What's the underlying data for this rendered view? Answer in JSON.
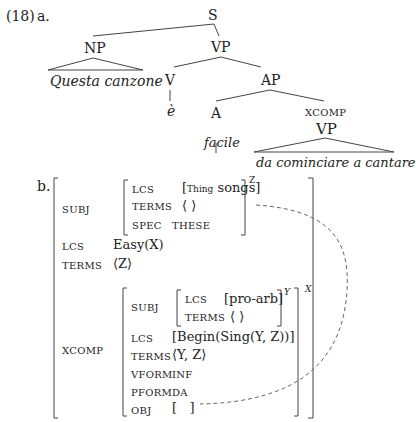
{
  "example": {
    "number": "(18)",
    "part_a": "a.",
    "part_b": "b."
  },
  "tree": {
    "root": "S",
    "np": "NP",
    "np_leaf": "Questa canzone",
    "vp": "VP",
    "v": "V",
    "v_leaf": "è",
    "ap": "AP",
    "a": "A",
    "a_leaf": "facile",
    "xcomp_label": "XCOMP",
    "xcomp_vp": "VP",
    "xcomp_leaf": "da cominciare a cantare"
  },
  "avm": {
    "subj": {
      "attr": "SUBJ",
      "lcs_attr": "LCS",
      "lcs_sub": "Thing",
      "lcs_val": "songs",
      "terms_attr": "TERMS",
      "terms_val": "⟨ ⟩",
      "spec_attr": "SPEC",
      "spec_val": "THESE",
      "index": "Z"
    },
    "lcs_attr": "LCS",
    "lcs_val": "Easy(X)",
    "terms_attr": "TERMS",
    "terms_val": "⟨Z⟩",
    "xcomp": {
      "attr": "XCOMP",
      "index": "X",
      "subj": {
        "attr": "SUBJ",
        "lcs_attr": "LCS",
        "lcs_val": "[pro-arb]",
        "terms_attr": "TERMS",
        "terms_val": "⟨ ⟩",
        "index": "Y"
      },
      "lcs_attr": "LCS",
      "lcs_val": "[Begin(Sing(Y, Z))]",
      "terms_attr": "TERMS",
      "terms_val": "⟨Y, Z⟩",
      "vform_attr": "VFORM",
      "vform_val": "INF",
      "pform_attr": "PFORM",
      "pform_val": "DA",
      "obj_attr": "OBJ",
      "obj_val": "[   ]"
    }
  }
}
